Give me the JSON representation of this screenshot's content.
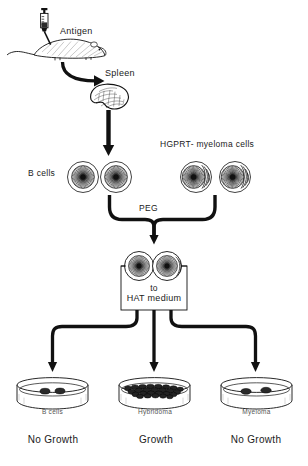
{
  "diagram": {
    "labels": {
      "antigen": "Antigen",
      "spleen": "Spleen",
      "b_cells": "B cells",
      "myeloma_source": "HGPRT- myeloma cells",
      "peg": "PEG",
      "hat_line1": "to",
      "hat_line2": "HAT  medium"
    },
    "dishes": [
      {
        "name": "B cells",
        "outcome": "No Growth",
        "colony_style": "sparse"
      },
      {
        "name": "Hybridoma",
        "outcome": "Growth",
        "colony_style": "dense"
      },
      {
        "name": "Myeloma",
        "outcome": "No Growth",
        "colony_style": "sparse"
      }
    ],
    "colors": {
      "ink": "#111111",
      "line": "#1a1a1a",
      "label": "#1a1a1a",
      "dish_label": "#555555",
      "fill": "#ffffff"
    },
    "icons": {
      "syringe": "syringe-icon",
      "mouse": "mouse-icon",
      "spleen": "spleen-icon",
      "cell": "cell-icon",
      "petri_dish": "petri-dish-icon",
      "arrow": "arrow-icon"
    }
  }
}
